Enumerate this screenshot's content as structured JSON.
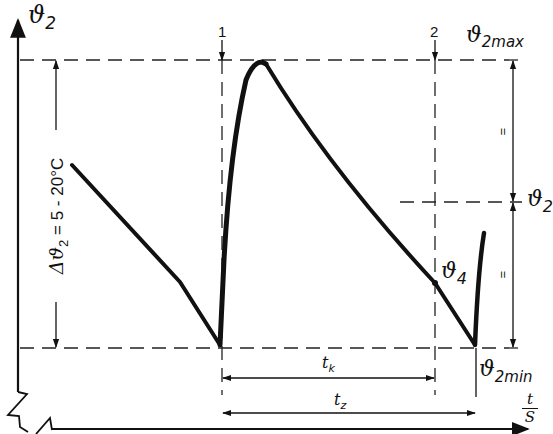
{
  "diagram": {
    "y_axis": {
      "symbol": "ϑ",
      "subscript": "2"
    },
    "x_axis": {
      "numerator": "t",
      "denominator": "S"
    },
    "markers": {
      "marker_1": "1",
      "marker_2": "2"
    },
    "levels": {
      "max": {
        "symbol": "ϑ",
        "subscript": "2max"
      },
      "mid": {
        "symbol": "ϑ",
        "subscript": "2"
      },
      "min": {
        "symbol": "ϑ",
        "subscript": "2min"
      }
    },
    "point_label": {
      "symbol": "ϑ",
      "subscript": "4"
    },
    "delta_label": {
      "prefix": "Δϑ",
      "subscript": "2",
      "text": " = 5 - 20°C"
    },
    "equal_marks": {
      "upper": "=",
      "lower": "="
    },
    "intervals": {
      "tk": {
        "symbol": "t",
        "subscript": "k"
      },
      "tz": {
        "symbol": "t",
        "subscript": "z"
      }
    },
    "colors": {
      "line": "#111111",
      "background": "#ffffff"
    }
  }
}
